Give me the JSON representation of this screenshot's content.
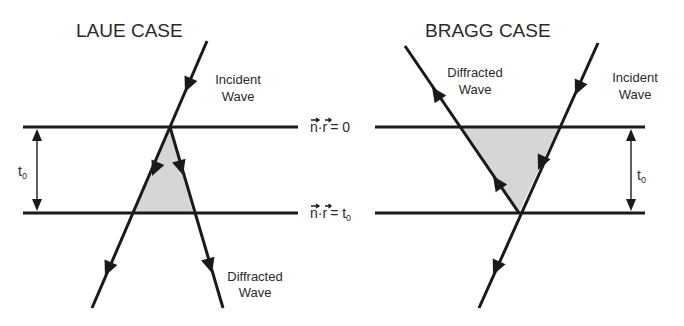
{
  "figure": {
    "colors": {
      "line": "#1a1a1a",
      "fill": "#d6d6d6",
      "text": "#2a2a2a"
    },
    "laue": {
      "title": "LAUE CASE",
      "incident_line1": "Incident",
      "incident_line2": "Wave",
      "diffracted_line1": "Diffracted",
      "diffracted_line2": "Wave",
      "thickness": "t",
      "thickness_sub": "0"
    },
    "bragg": {
      "title": "BRAGG CASE",
      "incident_line1": "Incident",
      "incident_line2": "Wave",
      "diffracted_line1": "Diffracted",
      "diffracted_line2": "Wave",
      "thickness": "t",
      "thickness_sub": "0"
    },
    "surfaces": {
      "top_lhs": "n·r",
      "top_rhs": "= 0",
      "bottom_lhs": "n·r",
      "bottom_rhs": "= t",
      "bottom_rhs_sub": "0"
    }
  }
}
